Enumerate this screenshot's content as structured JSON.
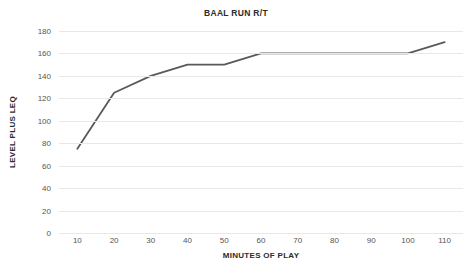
{
  "chart_data": {
    "type": "line",
    "title": "BAAL RUN R/T",
    "xlabel": "MINUTES OF PLAY",
    "ylabel": "LEVEL PLUS LEQ",
    "x": [
      10,
      20,
      30,
      40,
      50,
      60,
      70,
      80,
      90,
      100,
      110
    ],
    "values": [
      75,
      125,
      140,
      150,
      150,
      160,
      160,
      160,
      160,
      160,
      170
    ],
    "series": [
      {
        "name": "BAAL RUN R/T",
        "values": [
          75,
          125,
          140,
          150,
          150,
          160,
          160,
          160,
          160,
          160,
          170
        ]
      }
    ],
    "xlim": [
      5,
      115
    ],
    "ylim": [
      0,
      180
    ],
    "x_ticks": [
      "10",
      "20",
      "30",
      "40",
      "50",
      "60",
      "70",
      "80",
      "90",
      "100",
      "110"
    ],
    "y_ticks": [
      "0",
      "20",
      "40",
      "60",
      "80",
      "100",
      "120",
      "140",
      "160",
      "180"
    ],
    "y_tick_values": [
      0,
      20,
      40,
      60,
      80,
      100,
      120,
      140,
      160,
      180
    ],
    "grid": "horizontal",
    "legend": "none",
    "line_color": "#595959",
    "grid_color": "#e8e8e8",
    "background_color": "#ffffff",
    "text_color": "#555555"
  }
}
